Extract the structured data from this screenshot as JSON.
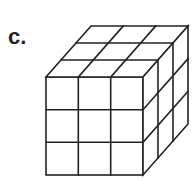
{
  "label": "c.",
  "figure": {
    "type": "isometric-cube",
    "grid": [
      3,
      3,
      3
    ],
    "stroke_color": "#222222",
    "fill_color": "#ffffff"
  }
}
